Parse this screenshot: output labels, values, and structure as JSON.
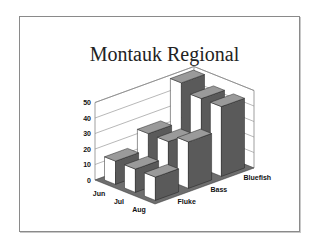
{
  "slide": {
    "title": "Montauk Regional",
    "border_color": "#8a8a8a"
  },
  "chart_data": {
    "type": "bar",
    "subtype": "3d-column",
    "title": "Montauk Regional",
    "categories": [
      "Jun",
      "Jul",
      "Aug"
    ],
    "series": [
      {
        "name": "Fluke",
        "values": [
          15,
          15,
          15
        ]
      },
      {
        "name": "Bass",
        "values": [
          25,
          25,
          30
        ]
      },
      {
        "name": "Bluefish",
        "values": [
          50,
          45,
          45
        ]
      }
    ],
    "xlabel": "",
    "ylabel": "",
    "yticks": [
      "0",
      "10",
      "20",
      "30",
      "40",
      "50"
    ],
    "ylim": [
      0,
      50
    ],
    "grid": true,
    "legend": "none",
    "depth_axis_labels": [
      "Fluke",
      "Bass",
      "Bluefish"
    ],
    "colors": {
      "front": "#ffffff",
      "side": "#5a5a5a",
      "top": "#9a9a9a",
      "floor": "#6e6e6e"
    }
  }
}
